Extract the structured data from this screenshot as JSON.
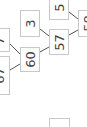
{
  "diagram": {
    "type": "tree",
    "orientation": "rotated-90",
    "nodes": [
      {
        "id": "n67",
        "label": "67"
      },
      {
        "id": "n7",
        "label": "7"
      },
      {
        "id": "n60",
        "label": "60"
      },
      {
        "id": "n3",
        "label": "3"
      },
      {
        "id": "n57",
        "label": "57"
      },
      {
        "id": "n5",
        "label": "5"
      },
      {
        "id": "n58",
        "label": "58"
      },
      {
        "id": "nblank",
        "label": ""
      }
    ],
    "edges": [
      {
        "from": "n67",
        "to": "n60"
      },
      {
        "from": "n7",
        "to": "n60"
      },
      {
        "from": "n60",
        "to": "n57"
      },
      {
        "from": "n3",
        "to": "n57"
      },
      {
        "from": "n57",
        "to": "n58"
      },
      {
        "from": "n5",
        "to": "n58"
      }
    ],
    "colors": {
      "border": "#c8c8c8",
      "edge": "#555555",
      "text": "#444444"
    }
  }
}
